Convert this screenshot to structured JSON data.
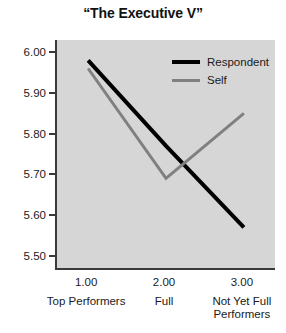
{
  "chart_data": {
    "type": "line",
    "title": "“The Executive V”",
    "xlabel": "",
    "ylabel": "",
    "x": [
      1.0,
      2.0,
      3.0
    ],
    "categories": [
      "Top Performers",
      "Full",
      "Not Yet Full Performers"
    ],
    "xtick_labels": [
      "1.00",
      "2.00",
      "3.00"
    ],
    "ytick_labels": [
      "6.00",
      "5.90",
      "5.80",
      "5.70",
      "5.60",
      "5.50"
    ],
    "ytick_values": [
      6.0,
      5.9,
      5.8,
      5.7,
      5.6,
      5.5
    ],
    "ylim": [
      5.47,
      6.03
    ],
    "xlim": [
      0.6,
      3.4
    ],
    "grid": false,
    "legend_position": "top-right",
    "series": [
      {
        "name": "Respondent",
        "values": [
          5.98,
          5.77,
          5.57
        ],
        "color": "#000000"
      },
      {
        "name": "Self",
        "values": [
          5.96,
          5.69,
          5.85
        ],
        "color": "#808080"
      }
    ]
  },
  "title": {
    "text": "“The Executive V”"
  },
  "axes": {
    "y": {
      "ticks": [
        {
          "label": "6.00",
          "value": 6.0
        },
        {
          "label": "5.90",
          "value": 5.9
        },
        {
          "label": "5.80",
          "value": 5.8
        },
        {
          "label": "5.70",
          "value": 5.7
        },
        {
          "label": "5.60",
          "value": 5.6
        },
        {
          "label": "5.50",
          "value": 5.5
        }
      ]
    },
    "x": {
      "ticks": [
        {
          "value_label": "1.00",
          "category": "Top Performers"
        },
        {
          "value_label": "2.00",
          "category": "Full"
        },
        {
          "value_label": "3.00",
          "category": "Not Yet Full Performers"
        }
      ]
    }
  },
  "legend": {
    "entries": [
      {
        "label": "Respondent",
        "color": "#000000"
      },
      {
        "label": "Self",
        "color": "#808080"
      }
    ]
  },
  "colors": {
    "plot_background": "#d6d6d6",
    "axis": "#3a3a3a",
    "respondent": "#000000",
    "self": "#808080",
    "page_background": "#ffffff"
  }
}
